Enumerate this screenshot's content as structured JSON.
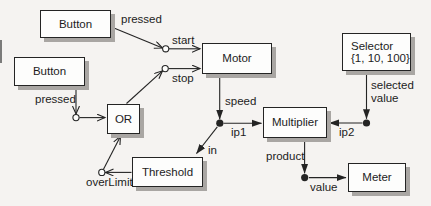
{
  "diagram": {
    "nodes": {
      "button1": {
        "label": "Button"
      },
      "button2": {
        "label": "Button"
      },
      "motor": {
        "label": "Motor"
      },
      "selector": {
        "label": "Selector",
        "range": "{1, 10, 100}"
      },
      "or_gate": {
        "label": "OR"
      },
      "threshold": {
        "label": "Threshold"
      },
      "multiplier": {
        "label": "Multiplier"
      },
      "meter": {
        "label": "Meter"
      }
    },
    "edge_labels": {
      "button1_pressed": "pressed",
      "start": "start",
      "stop": "stop",
      "button2_pressed": "pressed",
      "over_limit": "overLimit",
      "in": "in",
      "speed": "speed",
      "ip1": "ip1",
      "ip2": "ip2",
      "selected_line1": "selected",
      "selected_line2": "value",
      "product": "product",
      "value": "value"
    },
    "colors": {
      "background": "#f5f3f1",
      "box_fill": "#fdfdfc",
      "box_border": "#242424",
      "box_shadow": "#a9a6a3",
      "line": "#242424",
      "text": "#1c1c1c"
    }
  }
}
